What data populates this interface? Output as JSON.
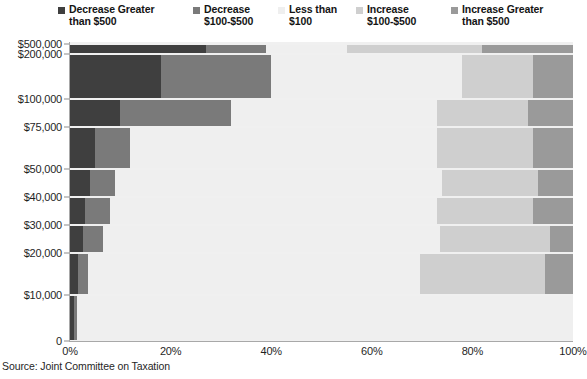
{
  "chart_data": {
    "type": "bar",
    "orientation": "horizontal",
    "stacked": true,
    "normalized": "100%",
    "title": "",
    "subtitle": "",
    "xlabel": "",
    "ylabel": "",
    "xlim": [
      0,
      100
    ],
    "grid": false,
    "legend_position": "top",
    "source": "Source: Joint Committee on Taxation",
    "xtick_labels": [
      "0%",
      "20%",
      "40%",
      "60%",
      "80%",
      "100%"
    ],
    "xtick_values": [
      0,
      20,
      40,
      60,
      80,
      100
    ],
    "ytick_labels": [
      "$500,000",
      "$200,000",
      "$100,000",
      "$75,000",
      "$50,000",
      "$40,000",
      "$30,000",
      "$20,000",
      "$10,000",
      "0"
    ],
    "categories": [
      "$500,000",
      "$200,000",
      "$100,000",
      "$75,000",
      "$50,000",
      "$40,000",
      "$30,000",
      "$20,000",
      "$10,000"
    ],
    "series": [
      {
        "name": "Decrease Greater than $500",
        "color": "#3f3f3f",
        "values": [
          27,
          18,
          10,
          5,
          4,
          3,
          2.5,
          1.5,
          0.7
        ]
      },
      {
        "name": "Decrease $100-$500",
        "color": "#7a7a7a",
        "values": [
          12,
          22,
          22,
          7,
          5,
          5,
          4,
          2,
          0.6
        ]
      },
      {
        "name": "Less than $100",
        "color": "#efefef",
        "values": [
          16,
          38,
          41,
          61,
          65,
          65,
          67,
          66,
          98.7
        ]
      },
      {
        "name": "Increase $100-$500",
        "color": "#cfcfcf",
        "values": [
          27,
          14,
          18,
          19,
          19,
          19,
          22,
          25,
          0.0
        ]
      },
      {
        "name": "Increase Greater than $500",
        "color": "#9a9a9a",
        "values": [
          18,
          8,
          9,
          8,
          7,
          8,
          4.5,
          5.5,
          0.0
        ]
      }
    ]
  },
  "legend": {
    "items": [
      {
        "label": "Decrease Greater\nthan $500",
        "color": "#3f3f3f",
        "icon": "square-swatch"
      },
      {
        "label": "Decrease\n$100-$500",
        "color": "#7a7a7a",
        "icon": "square-swatch"
      },
      {
        "label": "Less than\n$100",
        "color": "#efefef",
        "icon": "square-swatch"
      },
      {
        "label": "Increase\n$100-$500",
        "color": "#cfcfcf",
        "icon": "square-swatch"
      },
      {
        "label": "Increase Greater\nthan $500",
        "color": "#9a9a9a",
        "icon": "square-swatch"
      }
    ]
  },
  "colors": {
    "plot_background": "#f0f0f0",
    "axis_line": "#a8a8a8",
    "text": "#1a1a1a"
  }
}
